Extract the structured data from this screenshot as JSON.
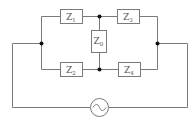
{
  "diagram": {
    "type": "circuit",
    "title": "",
    "components": [
      {
        "id": "Z1",
        "label": "Z",
        "sub": "1",
        "kind": "impedance",
        "position": "top-left"
      },
      {
        "id": "Z3",
        "label": "Z",
        "sub": "3",
        "kind": "impedance",
        "position": "top-right"
      },
      {
        "id": "Z0",
        "label": "Z",
        "sub": "0",
        "kind": "impedance",
        "position": "center-bridge"
      },
      {
        "id": "Z2",
        "label": "Z",
        "sub": "2",
        "kind": "impedance",
        "position": "bottom-left"
      },
      {
        "id": "Z4",
        "label": "Z",
        "sub": "4",
        "kind": "impedance",
        "position": "bottom-right"
      },
      {
        "id": "source",
        "label": "~",
        "kind": "ac-source",
        "position": "bottom-center"
      }
    ],
    "nodes": [
      "left",
      "right",
      "top-middle",
      "bottom-middle"
    ],
    "connections": [
      [
        "left",
        "Z1"
      ],
      [
        "Z1",
        "top-middle"
      ],
      [
        "top-middle",
        "Z3"
      ],
      [
        "Z3",
        "right"
      ],
      [
        "left",
        "Z2"
      ],
      [
        "Z2",
        "bottom-middle"
      ],
      [
        "bottom-middle",
        "Z4"
      ],
      [
        "Z4",
        "right"
      ],
      [
        "top-middle",
        "Z0"
      ],
      [
        "Z0",
        "bottom-middle"
      ],
      [
        "left",
        "source"
      ],
      [
        "source",
        "right"
      ]
    ],
    "colors": {
      "wire": "#7a7a7a",
      "node": "#111111",
      "label": "#555555"
    }
  },
  "labels": {
    "z1": {
      "main": "Z",
      "sub": "1"
    },
    "z2": {
      "main": "Z",
      "sub": "2"
    },
    "z3": {
      "main": "Z",
      "sub": "3"
    },
    "z4": {
      "main": "Z",
      "sub": "4"
    },
    "z0": {
      "main": "Z",
      "sub": "0"
    },
    "source": "~"
  }
}
